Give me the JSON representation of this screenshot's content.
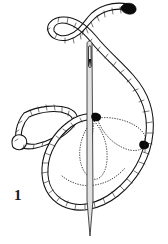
{
  "figure": {
    "step_number": "1",
    "caption": "",
    "background_color": "#ffffff",
    "ink_color": "#111111",
    "width": 168,
    "height": 244
  },
  "illustration": {
    "title": "detached-chain-stitch-step-1",
    "subject": "embroidery needle and thread forming a looped stitch",
    "elements": [
      {
        "name": "working-thread",
        "description": "twisted cord drawn as double outline with tick hatching",
        "stroke_color": "#111111",
        "fill_color": "#ffffff"
      },
      {
        "name": "thread-free-end",
        "description": "dark blunt tip at upper right end of thread",
        "color": "#0a0a0a",
        "position": {
          "x": 130,
          "y": 13
        }
      },
      {
        "name": "completed-loop",
        "description": "finished detached chain loop lying to the left",
        "stroke_color": "#111111"
      },
      {
        "name": "loop-knot",
        "description": "small rounded knot at lower left of completed loop",
        "position": {
          "x": 18,
          "y": 146
        }
      },
      {
        "name": "needle",
        "description": "straight sewing needle piercing vertically through the fabric",
        "fill_color": "#e2e2e2",
        "stroke_color": "#2a2a2a"
      },
      {
        "name": "needle-eye",
        "description": "elongated slot near needle top with dark shading",
        "fill_color": "#111111"
      },
      {
        "name": "hidden-thread-paths",
        "description": "dotted teardrop curves showing thread beneath the fabric",
        "stroke_color": "#3a3a3a",
        "style": "dotted"
      },
      {
        "name": "entry-point-marker",
        "description": "black dot marking where the thread enters the fabric",
        "position": {
          "x": 96,
          "y": 117
        }
      },
      {
        "name": "exit-point-marker",
        "description": "black dot marking where the thread exits the fabric",
        "position": {
          "x": 144,
          "y": 145
        }
      }
    ]
  },
  "labels": {
    "step": "1"
  }
}
